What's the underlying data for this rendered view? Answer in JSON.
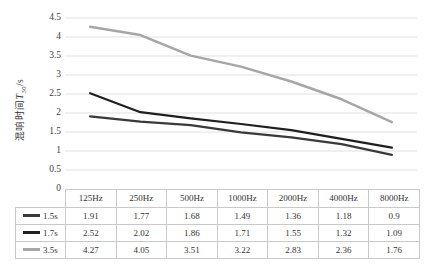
{
  "chart": {
    "ylabel_text": "混响时间",
    "ylabel_symbol": "T",
    "ylabel_sub": "30",
    "ylabel_unit": "/s",
    "grid_color": "#e1e1e1",
    "axis_text_color": "#404040",
    "table_border_color": "#c9c9c9"
  },
  "chart_data": {
    "type": "line",
    "title": "",
    "xlabel": "",
    "ylabel": "混响时间 T30/s",
    "categories": [
      "125Hz",
      "250Hz",
      "500Hz",
      "1000Hz",
      "2000Hz",
      "4000Hz",
      "8000Hz"
    ],
    "series": [
      {
        "name": "1.5s",
        "values": [
          1.91,
          1.77,
          1.68,
          1.49,
          1.36,
          1.18,
          0.9
        ],
        "color": "#3a3a3a"
      },
      {
        "name": "1.7s",
        "values": [
          2.52,
          2.02,
          1.86,
          1.71,
          1.55,
          1.32,
          1.09
        ],
        "color": "#1f1f1f"
      },
      {
        "name": "3.5s",
        "values": [
          4.27,
          4.05,
          3.51,
          3.22,
          2.83,
          2.36,
          1.76
        ],
        "color": "#a6a6a6"
      }
    ],
    "ylim": [
      0,
      4.5
    ],
    "y_ticks": [
      0,
      0.5,
      1,
      1.5,
      2,
      2.5,
      3,
      3.5,
      4,
      4.5
    ],
    "grid": true,
    "legend_position": "table-row-headers"
  }
}
